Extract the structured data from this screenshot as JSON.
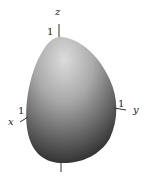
{
  "figure": {
    "axes": {
      "z": {
        "label": "z",
        "tick": "1"
      },
      "x": {
        "label": "x",
        "tick": "1"
      },
      "y": {
        "label": "y",
        "tick": "1"
      }
    },
    "colors": {
      "surface_light": "#d8d8d8",
      "surface_mid": "#8a8a8a",
      "surface_dark": "#1e1e1e",
      "axis": "#333333"
    }
  }
}
